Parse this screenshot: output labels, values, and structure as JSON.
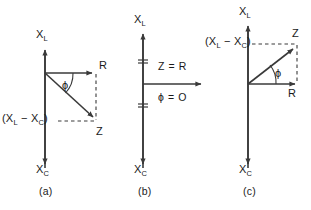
{
  "figure": {
    "background_color": "#ffffff",
    "stroke_color": "#3a3a3a",
    "text_color": "#1a1a1a",
    "width": 311,
    "height": 210
  },
  "panels": [
    {
      "id": "a",
      "caption": "(a)",
      "condition": "X_L less than X_C  (capacitive, Z lags below R)",
      "axis_up_label_main": "X",
      "axis_up_label_sub": "L",
      "axis_down_label_main": "X",
      "axis_down_label_sub": "C",
      "resistance_label": "R",
      "impedance_label": "Z",
      "angle_label": "ϕ",
      "reactance_label_open": "(X",
      "reactance_label_sub1": "L",
      "reactance_label_mid": " − X",
      "reactance_label_sub2": "C",
      "reactance_label_close": ")",
      "reactance_label_plain": "(XL − XC)",
      "origin": {
        "x": 45,
        "y": 73
      },
      "r_vector_end": {
        "x": 96,
        "y": 73
      },
      "z_vector_end": {
        "x": 97,
        "y": 121
      },
      "phi_angle_degrees": -43,
      "phi_sign": "negative"
    },
    {
      "id": "b",
      "caption": "(b)",
      "condition": "X_L equals X_C  (resonance, reactances cancel)",
      "axis_up_label_main": "X",
      "axis_up_label_sub": "L",
      "axis_down_label_main": "X",
      "axis_down_label_sub": "C",
      "impedance_equation": "Z = R",
      "angle_equation": "ϕ = O",
      "origin": {
        "x": 143,
        "y": 84
      },
      "r_vector_end": {
        "x": 205,
        "y": 84
      },
      "phi_angle_degrees": 0,
      "tick_marks": [
        {
          "y": 60
        },
        {
          "y": 106
        }
      ]
    },
    {
      "id": "c",
      "caption": "(c)",
      "condition": "X_L greater than X_C  (inductive, Z leads above R)",
      "axis_up_label_main": "X",
      "axis_up_label_sub": "L",
      "axis_down_label_main": "X",
      "axis_down_label_sub": "C",
      "resistance_label": "R",
      "impedance_label": "Z",
      "angle_label": "ϕ",
      "reactance_label_open": "(X",
      "reactance_label_sub1": "L",
      "reactance_label_mid": " − X",
      "reactance_label_sub2": "C",
      "reactance_label_close": ")",
      "reactance_label_plain": "(XL − XC)",
      "origin": {
        "x": 248,
        "y": 84
      },
      "r_vector_end": {
        "x": 299,
        "y": 84
      },
      "z_vector_end": {
        "x": 297,
        "y": 44
      },
      "phi_angle_degrees": 38,
      "phi_sign": "positive"
    }
  ]
}
